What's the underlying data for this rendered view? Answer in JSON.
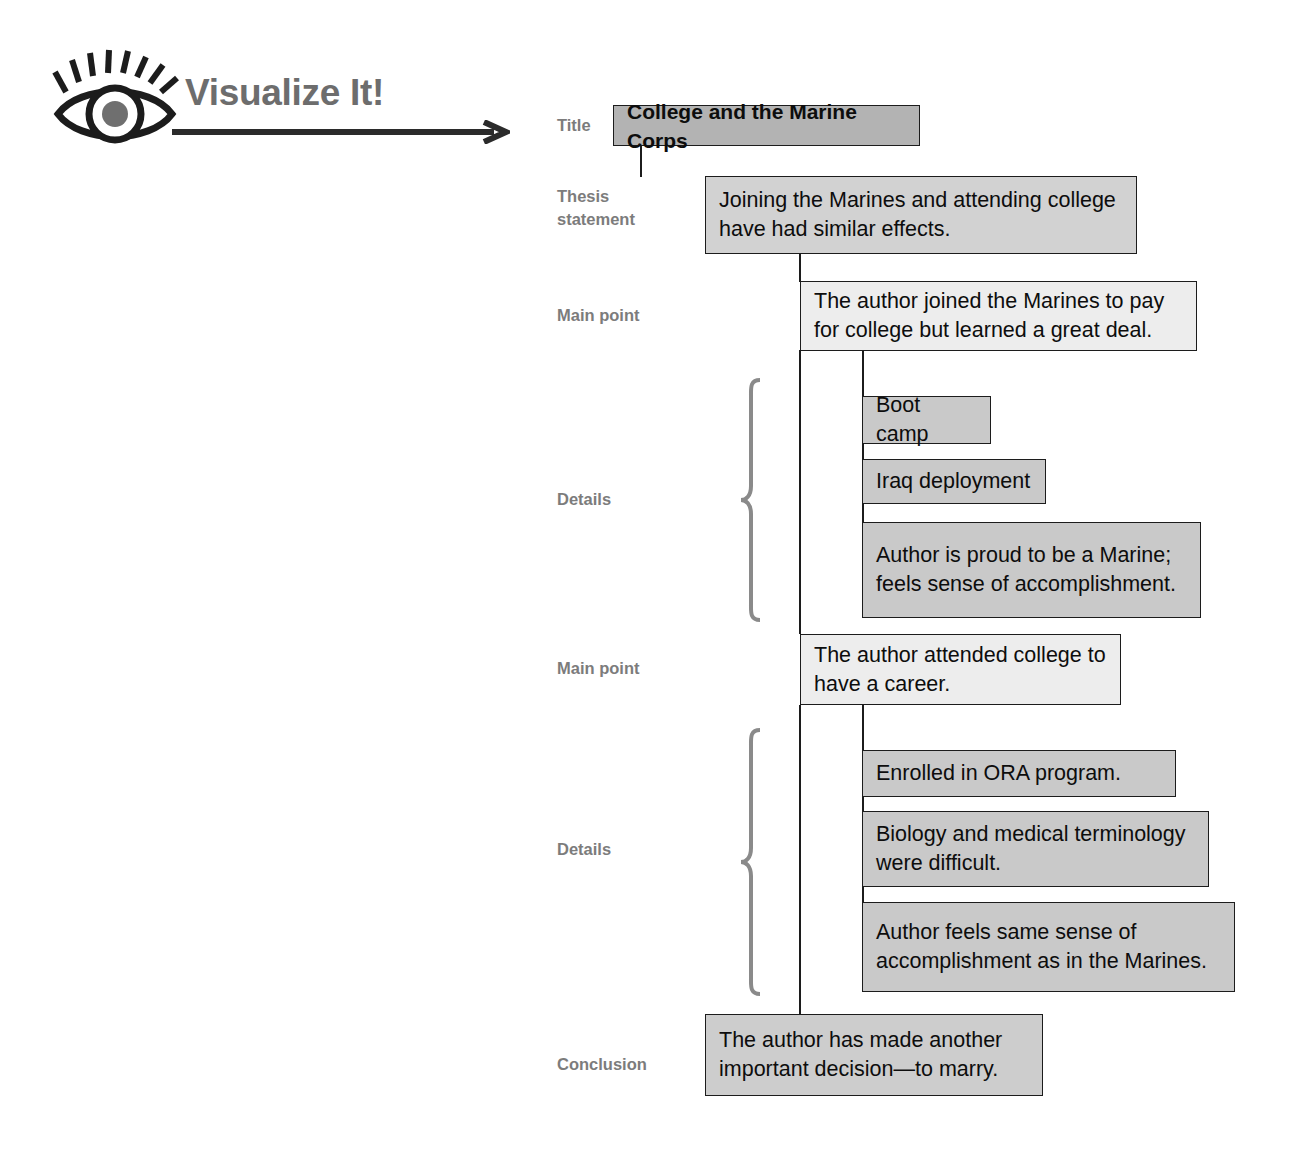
{
  "header": {
    "logo_text": "Visualize It!",
    "eye_icon_name": "eye-icon",
    "arrow_icon_name": "arrow-right-icon",
    "colors": {
      "logo_text": "#6d6d6d",
      "ink": "#1c1c1c"
    }
  },
  "diagram": {
    "type": "outline-map",
    "labels": {
      "title": "Title",
      "thesis": "Thesis\nstatement",
      "main_point_1": "Main point",
      "details_1": "Details",
      "main_point_2": "Main point",
      "details_2": "Details",
      "conclusion": "Conclusion"
    },
    "nodes": {
      "title": "College and the Marine Corps",
      "thesis": "Joining the Marines and attending college have had similar effects.",
      "main_point_1": "The author joined the Marines to pay for college but learned a great deal.",
      "details_1": [
        "Boot camp",
        "Iraq deployment",
        "Author is proud to be a  Marine; feels sense of accomplishment."
      ],
      "main_point_2": "The author attended college to have a career.",
      "details_2": [
        "Enrolled in ORA program.",
        "Biology and medical terminology were difficult.",
        "Author feels same sense of accomplishment as in the Marines."
      ],
      "conclusion": "The author has made another important decision—to marry."
    },
    "colors": {
      "title_fill": "#b3b3b3",
      "thesis_fill": "#d2d2d2",
      "main_fill": "#ededed",
      "detail_fill": "#c9c9c9",
      "conclusion_fill": "#cdcdcd",
      "label_text": "#7c7c7c",
      "brace": "#8a8a8a"
    }
  }
}
